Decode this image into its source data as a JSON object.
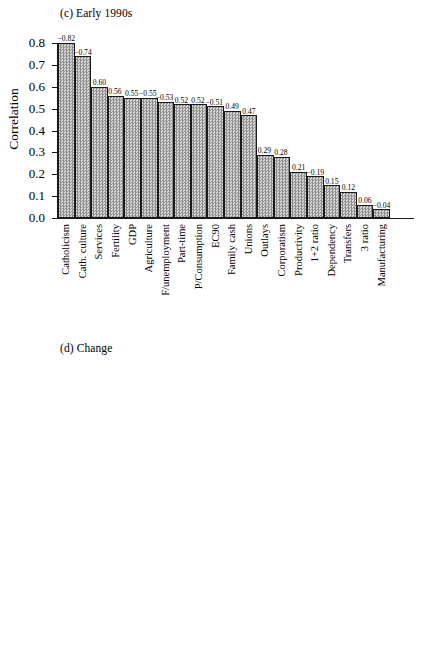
{
  "figure": {
    "axis_title": "Correlation",
    "y_ticks": [
      "0.0",
      "0.1",
      "0.2",
      "0.3",
      "0.4",
      "0.5",
      "0.6",
      "0.7",
      "0.8"
    ]
  },
  "chart_data": [
    {
      "type": "bar",
      "title": "(c) Early 1990s",
      "xlabel": "",
      "ylabel": "Correlation",
      "ylim": [
        0.0,
        0.8
      ],
      "grid": false,
      "legend": "none",
      "categories": [
        "Catholicism",
        "Cath. culture",
        "Services",
        "Fertility",
        "GDP",
        "Agriculture",
        "F/unemployment",
        "Part-time",
        "P/Consumption",
        "EC90",
        "Family cash",
        "Unions",
        "Outlays",
        "Corporatism",
        "Productivity",
        "1+2 ratio",
        "Dependency",
        "Transfers",
        "3 ratio",
        "Manufacturing"
      ],
      "values": [
        0.82,
        0.74,
        0.6,
        0.56,
        0.55,
        0.55,
        0.53,
        0.52,
        0.52,
        0.51,
        0.49,
        0.47,
        0.29,
        0.28,
        0.21,
        0.19,
        0.15,
        0.12,
        0.06,
        0.04
      ],
      "labels": [
        "−0.82",
        "−0.74",
        "0.60",
        "0.56",
        "0.55",
        "−0.55",
        "−0.53",
        "0.52",
        "0.52",
        "−0.51",
        "0.49",
        "0.47",
        "0.29",
        "0.28",
        "0.21",
        "−0.19",
        "0.15",
        "0.12",
        "0.06",
        "−0.04"
      ]
    },
    {
      "type": "bar",
      "title": "(d) Change",
      "xlabel": "",
      "ylabel": "Correlation",
      "ylim": [
        0.0,
        0.8
      ],
      "grid": false,
      "legend": "none",
      "categories": [
        "1960 FLF",
        "Productivity",
        "P/Consumption",
        "Manufacturing",
        "3 ratio",
        "Agriculture",
        "Fertility",
        "Catholicism",
        "Cath. culture",
        "Dependency",
        "GDP",
        "EC60",
        "F/unemployment",
        "Outlays",
        "1+2 ratio",
        "Services",
        "Corporatism",
        "Unions",
        "Transfers"
      ],
      "values": [
        0.62,
        0.51,
        0.47,
        0.45,
        0.44,
        0.39,
        0.34,
        0.3,
        0.3,
        0.29,
        0.29,
        0.16,
        0.1,
        0.06,
        0.06,
        0.06,
        0.05,
        0.05,
        0.04
      ],
      "labels": [
        "−0.62",
        "−0.51",
        "0.47",
        "−0.46",
        "0.44",
        "0.40",
        "−0.34",
        "−0.31",
        "−0.31",
        "−0.29",
        "−0.29",
        "0.17",
        "−0.10",
        "0.07",
        "−0.07",
        "−0.07",
        "0.06",
        "0.06",
        "0.05"
      ]
    }
  ]
}
